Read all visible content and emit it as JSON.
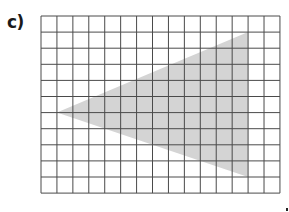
{
  "figure": {
    "label": "c)",
    "grid": {
      "columns": 15,
      "rows": 11
    },
    "shape": {
      "type": "triangle",
      "vertices": [
        [
          1,
          6
        ],
        [
          13,
          1
        ],
        [
          13,
          10
        ]
      ],
      "vertex_units": "grid cells (col, row) from top-left corner",
      "fill_color": "#d4d4d4"
    },
    "grid_line_color": "#4a4a4a"
  }
}
